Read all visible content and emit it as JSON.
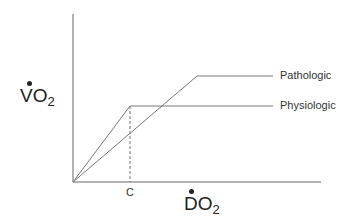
{
  "diagram": {
    "y_axis_label": {
      "main": "VO",
      "sub": "2",
      "dot_accent": true
    },
    "x_axis_label": {
      "main": "DO",
      "sub": "2",
      "dot_accent": true
    },
    "x_tick_label": "C",
    "curves": [
      {
        "name": "Pathologic",
        "points": [
          [
            73,
            182
          ],
          [
            197,
            76
          ],
          [
            273,
            76
          ]
        ]
      },
      {
        "name": "Physiologic",
        "points": [
          [
            73,
            182
          ],
          [
            130,
            106
          ],
          [
            273,
            106
          ]
        ]
      }
    ],
    "critical_line": {
      "x": 130,
      "y_from": 106,
      "y_to": 182,
      "style": "dashed"
    },
    "colors": {
      "axis": "#555555",
      "line": "#777777",
      "text": "#333333"
    }
  }
}
